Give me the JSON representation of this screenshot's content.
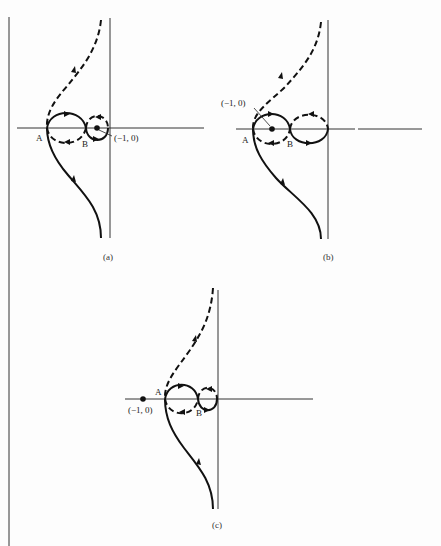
{
  "figure": {
    "panels": [
      {
        "id": "a",
        "caption": "(a)",
        "point_label": "(−1, 0)",
        "label_A": "A",
        "label_B": "B",
        "description": "Critical point (-1,0) lies inside the small right loop between B and origin"
      },
      {
        "id": "b",
        "caption": "(b)",
        "point_label": "(−1, 0)",
        "label_A": "A",
        "label_B": "B",
        "description": "Critical point (-1,0) lies inside the left loop between A and B"
      },
      {
        "id": "c",
        "caption": "(c)",
        "point_label": "(−1, 0)",
        "label_A": "A",
        "label_B": "B",
        "description": "Critical point (-1,0) lies outside to the left of point A"
      }
    ],
    "legend": {
      "solid": "positive frequency branch",
      "dashed": "negative frequency branch (mirror image)"
    },
    "colors": {
      "ink": "#111111",
      "background": "#fdfdfd"
    }
  }
}
